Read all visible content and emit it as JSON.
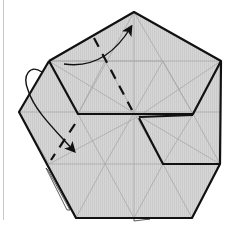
{
  "diagram": {
    "type": "origami-fold-step",
    "colors": {
      "paper": "#d4d4d4",
      "crease": "#a8a8a8",
      "edge": "#111111",
      "background": "#ffffff",
      "margin_line": "#c8c8c8"
    },
    "annotations": [
      {
        "kind": "valley-fold-line",
        "description": "dashed fold line upper flap"
      },
      {
        "kind": "valley-fold-line",
        "description": "dashed fold line left flap"
      },
      {
        "kind": "fold-arrow",
        "description": "curved arrow toward top vertex"
      },
      {
        "kind": "fold-arrow",
        "description": "looped arrow fold behind then down-right"
      }
    ]
  }
}
